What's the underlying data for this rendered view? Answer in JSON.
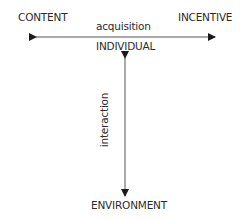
{
  "diagram": {
    "nodes": {
      "top_left": "CONTENT",
      "top_right": "INCENTIVE",
      "center": "INDIVIDUAL",
      "bottom": "ENVIRONMENT"
    },
    "edges": {
      "horizontal": "acquisition",
      "vertical": "interaction"
    },
    "colors": {
      "line": "#555555",
      "text": "#2b2b2b"
    }
  }
}
